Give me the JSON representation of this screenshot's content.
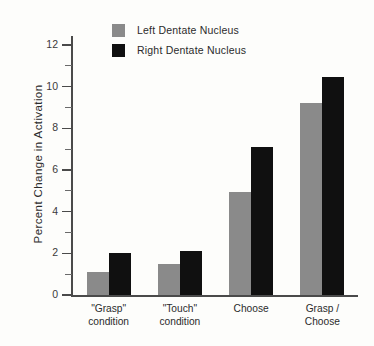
{
  "chart_data": {
    "type": "bar",
    "title": "",
    "xlabel": "",
    "ylabel": "Percent Change in Activation",
    "ylim": [
      0,
      12
    ],
    "y_ticks": [
      0,
      2,
      4,
      6,
      8,
      10,
      12
    ],
    "y_minor_ticks": [
      1,
      3,
      5,
      7,
      9,
      11
    ],
    "grid": false,
    "legend_position": "top-left",
    "categories": [
      "\"Grasp\"\ncondition",
      "\"Touch\"\ncondition",
      "Choose",
      "Grasp / Choose"
    ],
    "series": [
      {
        "name": "Left Dentate Nucleus",
        "color": "#8a8a8a",
        "values": [
          1.1,
          1.5,
          4.95,
          9.2
        ]
      },
      {
        "name": "Right Dentate Nucleus",
        "color": "#101010",
        "values": [
          2.0,
          2.1,
          7.1,
          10.45
        ]
      }
    ]
  },
  "axis": {
    "tick_labels": [
      "0",
      "2",
      "4",
      "6",
      "8",
      "10",
      "12"
    ]
  },
  "legend": {
    "items": [
      {
        "label": "Left Dentate Nucleus",
        "swatch": "left-swatch"
      },
      {
        "label": "Right Dentate Nucleus",
        "swatch": "right-swatch"
      }
    ]
  }
}
